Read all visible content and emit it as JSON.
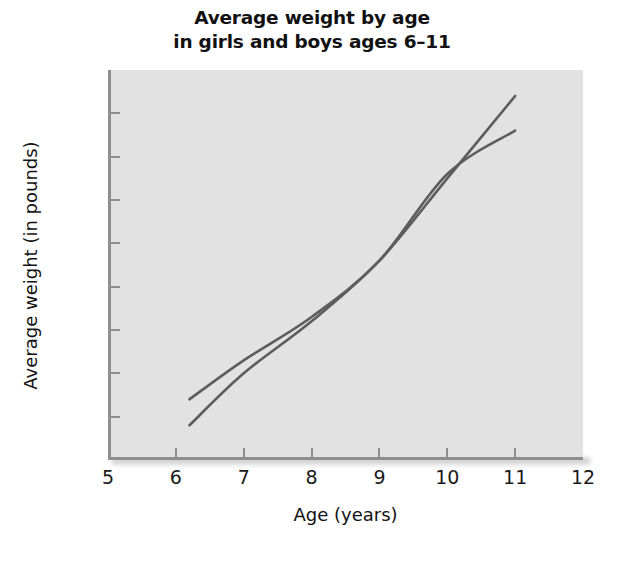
{
  "chart_data": {
    "type": "line",
    "title_line1": "Average weight by age",
    "title_line2": "in girls and boys ages 6–11",
    "xlabel": "Age (years)",
    "ylabel": "Average weight (in pounds)",
    "xlim": [
      5,
      12
    ],
    "ylim": [
      40,
      85
    ],
    "xticks": [
      5,
      6,
      7,
      8,
      9,
      10,
      11,
      12
    ],
    "yticks": [
      40,
      45,
      50,
      55,
      60,
      65,
      70,
      75,
      80,
      85
    ],
    "xtick_labels": [
      "5",
      "6",
      "7",
      "8",
      "9",
      "10",
      "11",
      "12"
    ],
    "ytick_labels": [
      "40",
      "45",
      "50",
      "55",
      "60",
      "65",
      "70",
      "75",
      "80",
      "85"
    ],
    "grid": false,
    "legend": "none",
    "x": [
      6.2,
      7,
      8,
      9,
      10,
      11
    ],
    "series": [
      {
        "name": "girls",
        "color": "#5d5d5d",
        "values": [
          47,
          51.5,
          56.5,
          63,
          73,
          78
        ]
      },
      {
        "name": "boys",
        "color": "#5d5d5d",
        "values": [
          44,
          50,
          56,
          63,
          72.5,
          82
        ]
      }
    ],
    "annotations": [],
    "plot_background": "#e2e2e2",
    "axis_color": "#8e8e8e"
  },
  "axis_titles": {
    "x": "Age (years)",
    "y": "Average weight (in pounds)"
  }
}
